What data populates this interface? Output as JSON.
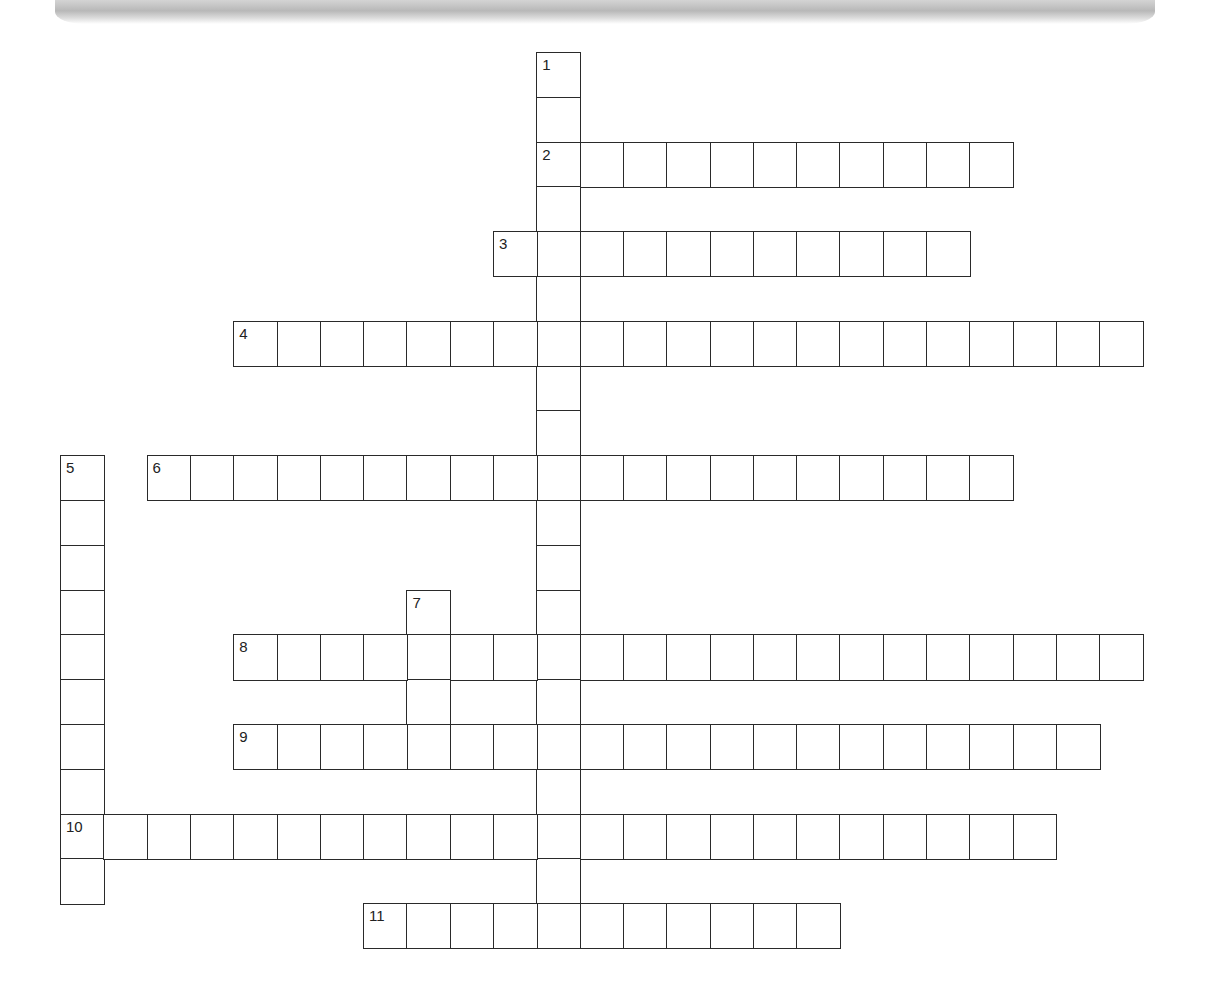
{
  "puzzle": {
    "type": "crossword",
    "grid": {
      "origin_x": 60,
      "origin_y": 52,
      "cell_w": 43.3,
      "cell_h": 44.8,
      "border_color": "#2a2a2a"
    },
    "entries": [
      {
        "number": 1,
        "direction": "down",
        "row": 0,
        "col": 11,
        "length": 20
      },
      {
        "number": 2,
        "direction": "across",
        "row": 2,
        "col": 11,
        "length": 11
      },
      {
        "number": 3,
        "direction": "across",
        "row": 4,
        "col": 10,
        "length": 11
      },
      {
        "number": 4,
        "direction": "across",
        "row": 6,
        "col": 4,
        "length": 21
      },
      {
        "number": 5,
        "direction": "down",
        "row": 9,
        "col": 0,
        "length": 10
      },
      {
        "number": 6,
        "direction": "across",
        "row": 9,
        "col": 2,
        "length": 20
      },
      {
        "number": 7,
        "direction": "down",
        "row": 12,
        "col": 8,
        "length": 4
      },
      {
        "number": 8,
        "direction": "across",
        "row": 13,
        "col": 4,
        "length": 21
      },
      {
        "number": 9,
        "direction": "across",
        "row": 15,
        "col": 4,
        "length": 20
      },
      {
        "number": 10,
        "direction": "across",
        "row": 17,
        "col": 0,
        "length": 23
      },
      {
        "number": 11,
        "direction": "across",
        "row": 19,
        "col": 7,
        "length": 11
      }
    ]
  }
}
